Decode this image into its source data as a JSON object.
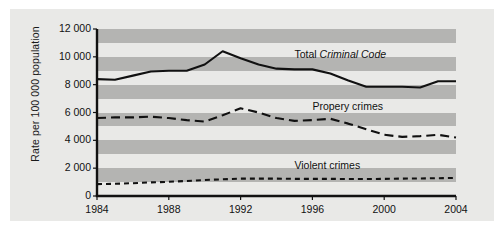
{
  "chart_data": {
    "type": "line",
    "title": "",
    "xlabel": "",
    "ylabel": "Rate per 100 000 population",
    "xlim": [
      1984,
      2004
    ],
    "ylim": [
      0,
      12000
    ],
    "grid": "alternating horizontal bands every 1000 units",
    "legend_position": "inline annotations next to each series",
    "x": [
      1984,
      1985,
      1986,
      1987,
      1988,
      1989,
      1990,
      1991,
      1992,
      1993,
      1994,
      1995,
      1996,
      1997,
      1998,
      1999,
      2000,
      2001,
      2002,
      2003,
      2004
    ],
    "ytick_labels": [
      "0",
      "2 000",
      "4 000",
      "6 000",
      "8 000",
      "10 000",
      "12 000"
    ],
    "ytick_values": [
      0,
      2000,
      4000,
      6000,
      8000,
      10000,
      12000
    ],
    "xtick_labels": [
      "1984",
      "1988",
      "1992",
      "1996",
      "2000",
      "2004"
    ],
    "xtick_values": [
      1984,
      1988,
      1992,
      1996,
      2000,
      2004
    ],
    "series": [
      {
        "name": "Total Criminal Code",
        "label_plain": "Total ",
        "label_italic": "Criminal Code",
        "style": "solid",
        "color": "#111111",
        "values": [
          8400,
          8350,
          8650,
          8950,
          9000,
          9000,
          9450,
          10400,
          9900,
          9450,
          9150,
          9100,
          9100,
          8800,
          8300,
          7850,
          7850,
          7850,
          7800,
          8250,
          8250
        ]
      },
      {
        "name": "Propery crimes",
        "label_plain": "Propery crimes",
        "label_italic": "",
        "style": "dashed",
        "color": "#111111",
        "values": [
          5600,
          5650,
          5650,
          5700,
          5600,
          5450,
          5350,
          5800,
          6300,
          6000,
          5600,
          5400,
          5450,
          5550,
          5200,
          4800,
          4400,
          4250,
          4300,
          4400,
          4200
        ]
      },
      {
        "name": "Violent crimes",
        "label_plain": "Violent crimes",
        "label_italic": "",
        "style": "short-dashed",
        "color": "#111111",
        "values": [
          850,
          880,
          920,
          980,
          1020,
          1080,
          1150,
          1200,
          1250,
          1250,
          1250,
          1230,
          1230,
          1230,
          1220,
          1220,
          1230,
          1250,
          1260,
          1280,
          1300
        ]
      }
    ],
    "annotations": [
      {
        "text": "Total Criminal Code",
        "x": 1995,
        "y": 10100
      },
      {
        "text": "Propery crimes",
        "x": 1996,
        "y": 6400
      },
      {
        "text": "Violent crimes",
        "x": 1995,
        "y": 2150
      }
    ]
  },
  "style": {
    "card_background": "#e9e9e7",
    "band_color": "#b4b4b2",
    "axis_color": "#111111",
    "text_color": "#111111"
  }
}
